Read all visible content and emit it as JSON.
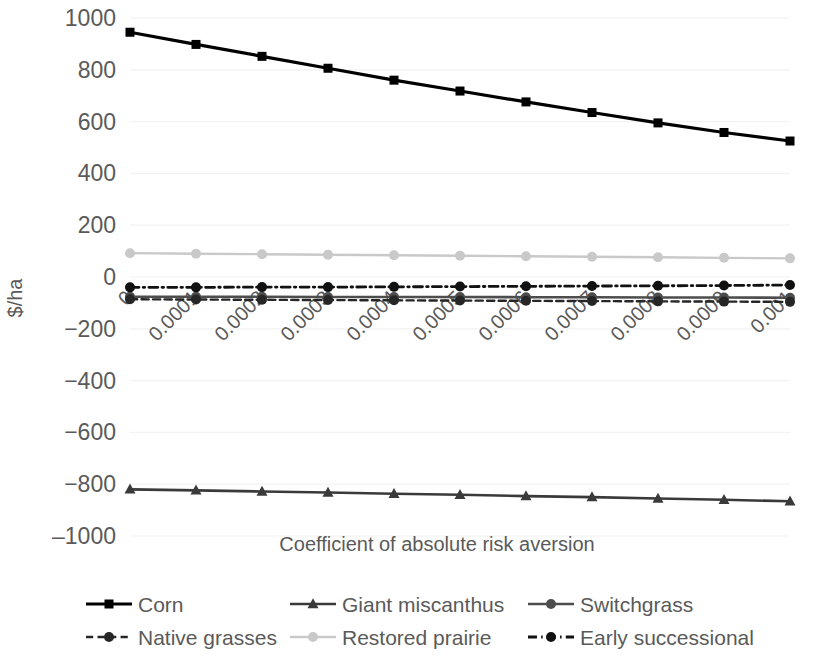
{
  "chart_data": {
    "type": "line",
    "title": "",
    "xlabel": "Coefficient of absolute risk aversion",
    "ylabel": "$/ha",
    "x": [
      0,
      0.0001,
      0.0002,
      0.0003,
      0.0004,
      0.0005,
      0.0006,
      0.0007,
      0.0008,
      0.0009,
      0.001
    ],
    "xtick_labels": [
      "0",
      "0.0001",
      "0.0002",
      "0.0003",
      "0.0004",
      "0.0005",
      "0.0006",
      "0.0007",
      "0.0008",
      "0.0009",
      "0.001"
    ],
    "ytick_labels": [
      "1000",
      "800",
      "600",
      "400",
      "200",
      "0",
      "−200",
      "−400",
      "−600",
      "−800",
      "‒1000"
    ],
    "ytick_values": [
      1000,
      800,
      600,
      400,
      200,
      0,
      -200,
      -400,
      -600,
      -800,
      -1000
    ],
    "ylim": [
      -1000,
      1000
    ],
    "xlim": [
      0,
      0.001
    ],
    "grid": "horizontal",
    "legend_position": "bottom",
    "series": [
      {
        "name": "Corn",
        "values": [
          945,
          898,
          852,
          806,
          760,
          718,
          676,
          635,
          595,
          558,
          525
        ],
        "color": "#000000",
        "marker": "square",
        "dash": "solid",
        "width": 3.2
      },
      {
        "name": "Giant miscanthus",
        "values": [
          -820,
          -824,
          -828,
          -832,
          -837,
          -841,
          -846,
          -850,
          -855,
          -860,
          -866
        ],
        "color": "#3a3a3a",
        "marker": "triangle",
        "dash": "solid",
        "width": 2.6
      },
      {
        "name": "Switchgrass",
        "values": [
          -76,
          -76,
          -76,
          -77,
          -77,
          -77,
          -78,
          -78,
          -79,
          -79,
          -80
        ],
        "color": "#4d4d4d",
        "marker": "circle",
        "dash": "solid",
        "width": 2.6
      },
      {
        "name": "Native grasses",
        "values": [
          -86,
          -87,
          -88,
          -89,
          -90,
          -91,
          -92,
          -93,
          -94,
          -95,
          -96
        ],
        "color": "#262626",
        "marker": "circle",
        "dash": "dashed",
        "width": 2.4
      },
      {
        "name": "Restored prairie",
        "values": [
          92,
          90,
          88,
          86,
          84,
          82,
          80,
          78,
          76,
          74,
          72
        ],
        "color": "#c9c9c9",
        "marker": "circle",
        "dash": "solid",
        "width": 2.4
      },
      {
        "name": "Early successional",
        "values": [
          -40,
          -40,
          -39,
          -39,
          -38,
          -37,
          -36,
          -35,
          -34,
          -33,
          -31
        ],
        "color": "#111111",
        "marker": "circle",
        "dash": "dashdot",
        "width": 2.8
      }
    ]
  },
  "legend": {
    "rows": [
      [
        "Corn",
        "Giant miscanthus",
        "Switchgrass"
      ],
      [
        "Native grasses",
        "Restored prairie",
        "Early successional"
      ]
    ]
  }
}
